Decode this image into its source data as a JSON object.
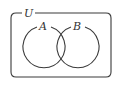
{
  "diagram": {
    "type": "venn",
    "universe_label": "U",
    "sets": [
      {
        "label": "A"
      },
      {
        "label": "B"
      }
    ],
    "colors": {
      "stroke": "#3a3a3a",
      "background": "#ffffff"
    }
  }
}
